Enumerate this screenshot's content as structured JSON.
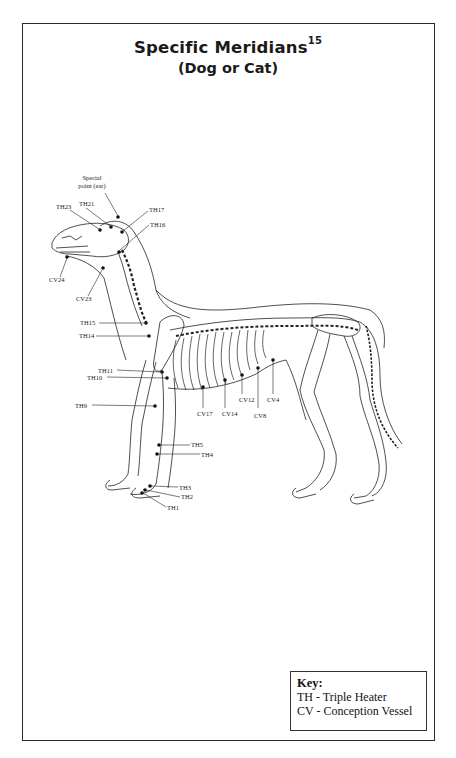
{
  "page": {
    "title": "Specific Meridians",
    "title_superscript": "15",
    "subtitle": "(Dog or Cat)"
  },
  "diagram": {
    "labels": {
      "special_point": [
        "Special",
        "point (ear)"
      ],
      "TH23": "TH23",
      "TH21": "TH21",
      "TH17": "TH17",
      "TH16": "TH16",
      "CV24": "CV24",
      "CV23": "CV23",
      "TH15": "TH15",
      "TH14": "TH14",
      "TH11": "TH11",
      "TH10": "TH10",
      "TH9": "TH9",
      "TH5": "TH5",
      "TH4": "TH4",
      "TH3": "TH3",
      "TH2": "TH2",
      "TH1": "TH1",
      "CV17": "CV17",
      "CV14": "CV14",
      "CV12": "CV12",
      "CV8": "CV8",
      "CV4": "CV4"
    },
    "point_color": "#111111",
    "line_color": "#222222"
  },
  "key": {
    "title": "Key:",
    "rows": [
      "TH - Triple Heater",
      "CV - Conception Vessel"
    ]
  }
}
